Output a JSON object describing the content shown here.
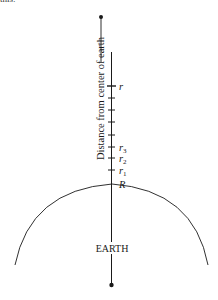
{
  "cropped_text": "this:",
  "diagram": {
    "axis_label": "Distance from center of earth",
    "body_label": "EARTH",
    "tick_labels": {
      "r": "r",
      "r3": "r",
      "r3_sub": "3",
      "r2": "r",
      "r2_sub": "2",
      "r1": "r",
      "r1_sub": "1",
      "R": "R"
    },
    "tick_positions_y": [
      86,
      98,
      110,
      122,
      135,
      147,
      158,
      170
    ],
    "colors": {
      "line": "#1a1a1a",
      "text": "#1a1a1a"
    }
  }
}
